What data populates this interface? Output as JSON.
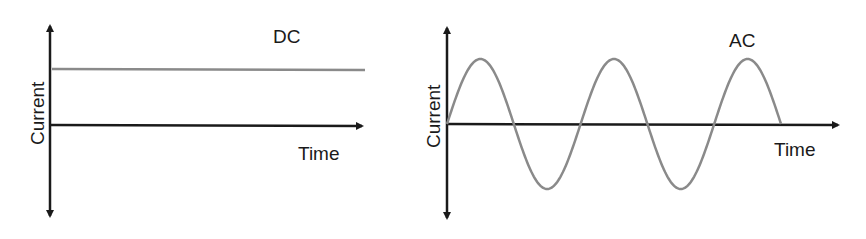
{
  "panels": [
    {
      "title": "DC",
      "xlabel": "Time",
      "ylabel": "Current",
      "signal": "constant",
      "level": 0.55
    },
    {
      "title": "AC",
      "xlabel": "Time",
      "ylabel": "Current",
      "signal": "sine",
      "cycles": 2.5,
      "amplitude": 0.65
    }
  ],
  "colors": {
    "axis": "#1a1a1a",
    "signal": "#8a8a8a"
  }
}
